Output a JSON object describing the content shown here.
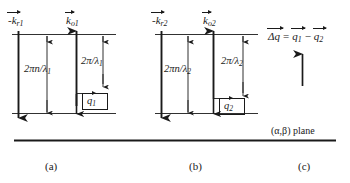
{
  "figure": {
    "background": "#ffffff",
    "ink": "#1a1a1a",
    "width": 350,
    "height": 183
  },
  "panels": [
    {
      "id": "a",
      "caption": "(a)",
      "labels": {
        "k_r": "-k",
        "k_r_sub": "r1",
        "k_o": "k",
        "k_o_sub": "o1",
        "left_magnitude": "2πn/λ",
        "left_magnitude_sub": "1",
        "right_magnitude": "2π/λ",
        "right_magnitude_sub": "1",
        "q": "q",
        "q_sub": "1"
      }
    },
    {
      "id": "b",
      "caption": "(b)",
      "labels": {
        "k_r": "-k",
        "k_r_sub": "r2",
        "k_o": "k",
        "k_o_sub": "o2",
        "left_magnitude": "2πn/λ",
        "left_magnitude_sub": "2",
        "right_magnitude": "2π/λ",
        "right_magnitude_sub": "2",
        "q": "q",
        "q_sub": "2"
      }
    },
    {
      "id": "c",
      "caption": "(c)",
      "labels": {
        "equation_lhs": "Δq",
        "equation_eq": "=",
        "equation_term1": "q",
        "equation_term1_sub": "1",
        "equation_minus": "−",
        "equation_term2": "q",
        "equation_term2_sub": "2",
        "plane": "(α,β) plane"
      }
    }
  ]
}
